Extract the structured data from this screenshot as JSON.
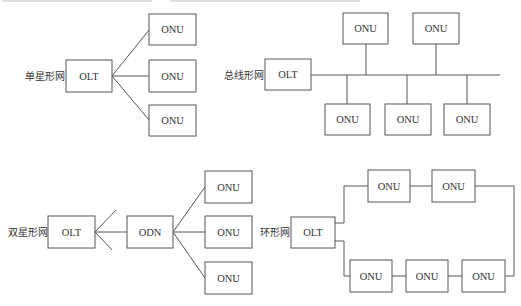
{
  "diagram": {
    "node_labels": {
      "olt": "OLT",
      "onu": "ONU",
      "odn": "ODN"
    },
    "single_star": {
      "label": "单星形网",
      "olt": "OLT",
      "onus": [
        "ONU",
        "ONU",
        "ONU"
      ]
    },
    "bus": {
      "label": "总线形网",
      "olt": "OLT",
      "onus_top": [
        "ONU",
        "ONU"
      ],
      "onus_bottom": [
        "ONU",
        "ONU",
        "ONU"
      ]
    },
    "double_star": {
      "label": "双星形网",
      "olt": "OLT",
      "odn": "ODN",
      "onus": [
        "ONU",
        "ONU",
        "ONU"
      ]
    },
    "ring": {
      "label": "环形网",
      "olt": "OLT",
      "onus_top": [
        "ONU",
        "ONU"
      ],
      "onus_bottom": [
        "ONU",
        "ONU",
        "ONU"
      ]
    }
  }
}
